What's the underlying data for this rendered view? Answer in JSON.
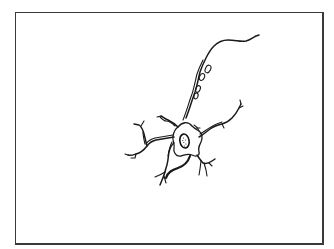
{
  "figure": {
    "style": "line-drawing",
    "parts": [
      "frame",
      "cell-body",
      "nucleus",
      "axon",
      "dendrites"
    ],
    "colors": {
      "ink": "#1a1a1a",
      "background": "#ffffff",
      "frame": "#3a3a3a"
    }
  }
}
